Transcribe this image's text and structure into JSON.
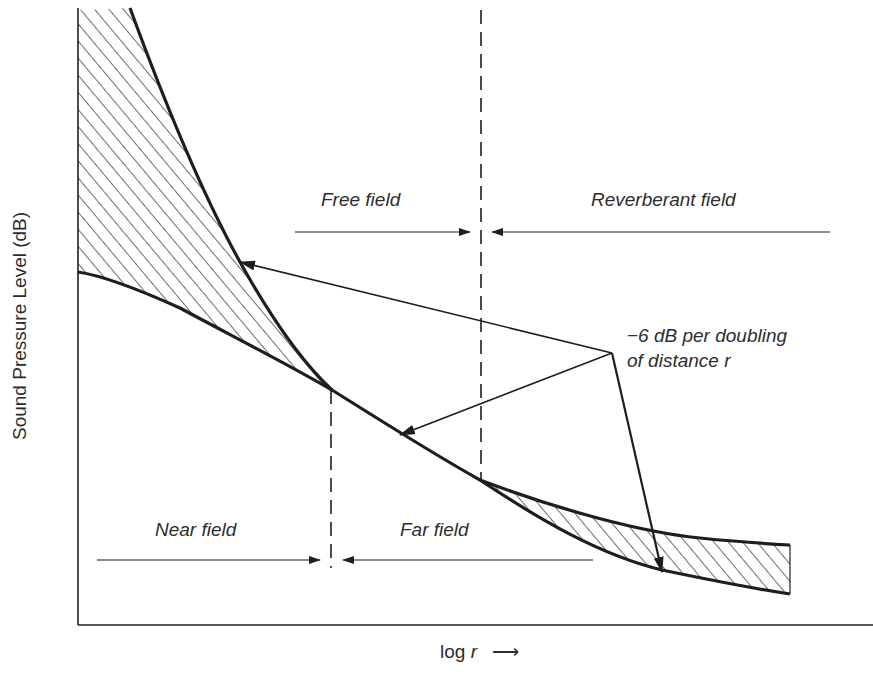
{
  "figure": {
    "y_axis_label": "Sound Pressure Level (dB)",
    "x_axis_label_main": "log ",
    "x_axis_label_var": "r",
    "x_axis_arrow": "⟶"
  },
  "regions": {
    "free_field": "Free field",
    "reverberant_field": "Reverberant field",
    "near_field": "Near field",
    "far_field": "Far field"
  },
  "annotation": {
    "line1": "−6 dB per doubling",
    "line2": "of distance r"
  },
  "colors": {
    "ink": "#1e1e1e",
    "text": "#2d2d2d",
    "background": "#ffffff"
  }
}
